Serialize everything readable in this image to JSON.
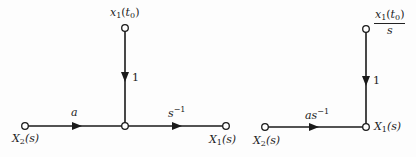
{
  "diagram": {
    "type": "signal-flow-graph",
    "graphs": [
      {
        "id": "left",
        "nodes": {
          "source": {
            "var": "X",
            "sub": "2",
            "arg": "(s)"
          },
          "initial": {
            "var": "x",
            "sub": "1",
            "arg_open": "(",
            "arg_var": "t",
            "arg_sub": "0",
            "arg_close": ")"
          },
          "output": {
            "var": "X",
            "sub": "1",
            "arg": "(s)"
          }
        },
        "branches": {
          "source_to_mid": "a",
          "initial_to_mid": "1",
          "mid_to_output": {
            "base": "s",
            "exp": "−1"
          }
        }
      },
      {
        "id": "right",
        "nodes": {
          "source": {
            "var": "X",
            "sub": "2",
            "arg": "(s)"
          },
          "initial": {
            "num_var": "x",
            "num_sub": "1",
            "num_open": "(",
            "num_arg_var": "t",
            "num_arg_sub": "0",
            "num_close": ")",
            "den": "s"
          },
          "output": {
            "var": "X",
            "sub": "1",
            "arg": "(s)"
          }
        },
        "branches": {
          "source_to_output": {
            "base": "as",
            "exp": "−1"
          },
          "initial_to_output": "1"
        }
      }
    ],
    "colors": {
      "line": "#1a1a1a",
      "node_fill": "#ffffff"
    }
  }
}
